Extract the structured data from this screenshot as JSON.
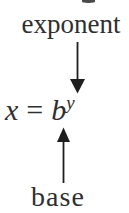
{
  "figure": {
    "top_label": "exponent",
    "bottom_label": "base",
    "equation": {
      "lhs": "x",
      "relation": "=",
      "base": "b",
      "exponent": "y",
      "display": "x = b^y"
    },
    "icons": {
      "down_arrow": "down-arrow-icon",
      "up_arrow": "up-arrow-icon"
    }
  },
  "colors": {
    "background": "#ffffff",
    "text": "#2f2f2f",
    "arrow": "#1f1f1f"
  }
}
